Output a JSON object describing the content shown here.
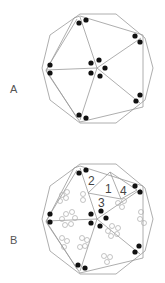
{
  "figure_a": {
    "label": "A"
  },
  "figure_b": {
    "label": "B",
    "region_labels": [
      "1",
      "2",
      "3",
      "4"
    ]
  },
  "colors": {
    "line": "#999999",
    "dot": "#111111",
    "ring": "#aaaaaa"
  }
}
